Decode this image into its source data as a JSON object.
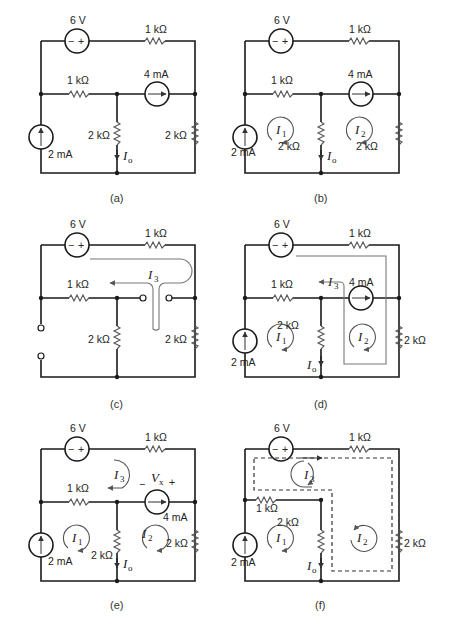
{
  "figure": {
    "panels": [
      {
        "id": "a",
        "caption": "(a)"
      },
      {
        "id": "b",
        "caption": "(b)"
      },
      {
        "id": "c",
        "caption": "(c)"
      },
      {
        "id": "d",
        "caption": "(d)"
      },
      {
        "id": "e",
        "caption": "(e)"
      },
      {
        "id": "f",
        "caption": "(f)"
      }
    ]
  },
  "labels": {
    "voltage_source": "6 V",
    "r_top": "1 kΩ",
    "r_mid": "1 kΩ",
    "current_source_4": "4 mA",
    "current_source_2": "2 mA",
    "r_center": "2 kΩ",
    "r_right": "2 kΩ",
    "minus": "−",
    "plus": "+"
  },
  "variables": {
    "Io": "I",
    "Io_sub": "o",
    "I1": "I",
    "I1_sub": "1",
    "I2": "I",
    "I2_sub": "2",
    "I3": "I",
    "I3_sub": "3",
    "Vx": "V",
    "Vx_sub": "x",
    "Vx_minus": "−",
    "Vx_plus": "+"
  }
}
